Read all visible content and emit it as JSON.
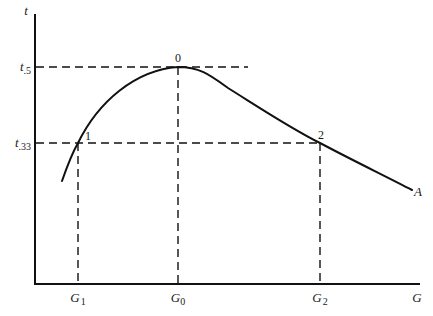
{
  "diagram": {
    "axes": {
      "y_label": "t",
      "x_label": "G"
    },
    "y_levels": [
      {
        "id": "t5",
        "main": "t",
        "sub": ".5"
      },
      {
        "id": "t33",
        "main": "t",
        "sub": ".33"
      }
    ],
    "x_levels": [
      {
        "id": "G1",
        "main": "G",
        "sub": "1"
      },
      {
        "id": "G0",
        "main": "G",
        "sub": "0"
      },
      {
        "id": "G2",
        "main": "G",
        "sub": "2"
      }
    ],
    "points": [
      {
        "id": "0",
        "label": "0"
      },
      {
        "id": "1",
        "label": "1"
      },
      {
        "id": "2",
        "label": "2"
      }
    ],
    "curve_label": "A"
  }
}
